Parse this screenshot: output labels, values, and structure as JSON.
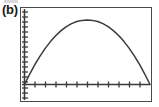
{
  "figure": {
    "label": "(b)",
    "caption_visible": false
  },
  "device": {
    "type": "graphing-calculator-screen",
    "frame_color": "#4a4a4a",
    "background_color": "#ffffff",
    "curve_color": "#3a3a3a",
    "axis_color": "#3a3a3a"
  },
  "chart_data": {
    "type": "line",
    "title": "(b)",
    "subtitle": "",
    "xlabel": "",
    "ylabel": "",
    "grid": false,
    "legend": null,
    "legend_position": "none",
    "axis_style": "calculator-screen",
    "xlim": [
      0,
      12
    ],
    "ylim": [
      0,
      10
    ],
    "x_tick_count": 12,
    "y_tick_count": 18,
    "x_tick_labels": [],
    "y_tick_labels": [],
    "annotations": [],
    "series": [
      {
        "name": "curve",
        "x": [
          0.0,
          0.5,
          1.0,
          1.5,
          2.0,
          2.5,
          3.0,
          3.5,
          4.0,
          4.5,
          5.0,
          5.5,
          6.0,
          6.5,
          7.0,
          7.5,
          8.0,
          8.5,
          9.0,
          9.5,
          10.0,
          10.5,
          11.0,
          11.5,
          12.0
        ],
        "y": [
          0.0,
          1.53,
          2.93,
          4.19,
          5.31,
          6.3,
          7.15,
          7.87,
          8.44,
          8.89,
          9.19,
          9.36,
          9.4,
          9.36,
          9.19,
          8.89,
          8.44,
          7.87,
          7.15,
          6.3,
          5.31,
          4.19,
          2.93,
          1.53,
          0.0
        ]
      }
    ],
    "peak": {
      "x": 6.0,
      "y": 9.4
    },
    "x_intercepts": [
      0.0,
      12.0
    ]
  }
}
